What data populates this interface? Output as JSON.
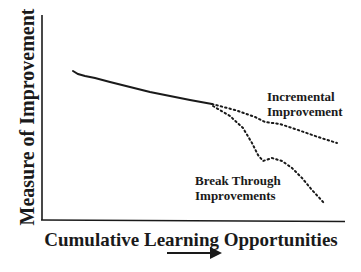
{
  "diagram": {
    "y_axis_label": "Measure of Improvement",
    "x_axis_label": "Cumulative Learning Opportunities",
    "curves": [
      {
        "name": "baseline",
        "style": "solid"
      },
      {
        "name": "incremental",
        "style": "dotted",
        "label_line1": "Incremental",
        "label_line2": "Improvement"
      },
      {
        "name": "breakthrough",
        "style": "dotted",
        "label_line1": "Break Through",
        "label_line2": "Improvements"
      }
    ],
    "arrow": "right-arrow",
    "colors": {
      "ink": "#1a1a1a",
      "background": "#ffffff"
    }
  }
}
